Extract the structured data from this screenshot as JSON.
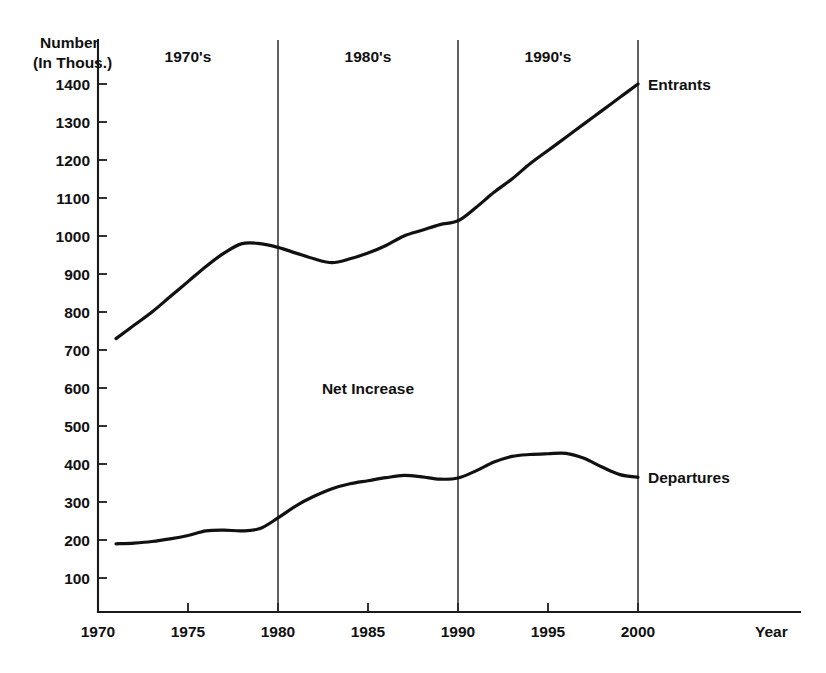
{
  "chart_data": {
    "type": "line",
    "title": "",
    "ylabel_line1": "Number",
    "ylabel_line2": "(In Thous.)",
    "xlabel": "Year",
    "xlim": [
      1970,
      2003
    ],
    "ylim": [
      0,
      1450
    ],
    "grid": false,
    "legend_position": "inline-right",
    "x_ticks": [
      1970,
      1975,
      1980,
      1985,
      1990,
      1995,
      2000
    ],
    "x_tick_labels": [
      "1970",
      "1975",
      "1980",
      "1985",
      "1990",
      "1995",
      "2000"
    ],
    "y_ticks": [
      100,
      200,
      300,
      400,
      500,
      600,
      700,
      800,
      900,
      1000,
      1100,
      1200,
      1300,
      1400
    ],
    "y_tick_labels": [
      "100",
      "200",
      "300",
      "400",
      "500",
      "600",
      "700",
      "800",
      "900",
      "1000",
      "1100",
      "1200",
      "1300",
      "1400"
    ],
    "x": [
      1971,
      1972,
      1973,
      1974,
      1975,
      1976,
      1977,
      1978,
      1979,
      1980,
      1981,
      1982,
      1983,
      1984,
      1985,
      1986,
      1987,
      1988,
      1989,
      1990,
      1991,
      1992,
      1993,
      1994,
      1995,
      1996,
      1997,
      1998,
      1999,
      2000
    ],
    "series": [
      {
        "name": "Entrants",
        "label": "Entrants",
        "values": [
          730,
          765,
          800,
          840,
          880,
          920,
          955,
          980,
          980,
          970,
          955,
          940,
          930,
          940,
          955,
          975,
          1000,
          1015,
          1030,
          1040,
          1075,
          1115,
          1150,
          1190,
          1225,
          1260,
          1295,
          1330,
          1365,
          1400
        ]
      },
      {
        "name": "Departures",
        "label": "Departures",
        "values": [
          190,
          192,
          196,
          203,
          212,
          224,
          226,
          224,
          230,
          258,
          290,
          315,
          335,
          348,
          356,
          364,
          370,
          366,
          360,
          363,
          382,
          405,
          420,
          425,
          427,
          428,
          415,
          392,
          372,
          365
        ]
      }
    ],
    "annotations": [
      {
        "text": "Net Increase",
        "x": 1985,
        "y": 600
      }
    ],
    "decade_bands": [
      {
        "label": "1970's",
        "start": 1970,
        "end": 1980
      },
      {
        "label": "1980's",
        "start": 1980,
        "end": 1990
      },
      {
        "label": "1990's",
        "start": 1990,
        "end": 2000
      }
    ],
    "divider_years": [
      1980,
      1990,
      2000
    ],
    "colors": {
      "line": "#111111",
      "axis": "#1a1a1a",
      "divider": "#2b2b2b",
      "background": "#ffffff"
    }
  }
}
